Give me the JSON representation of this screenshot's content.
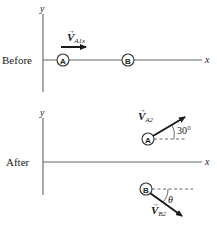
{
  "colors": {
    "ink": "#2a2a2a",
    "axis": "#555555",
    "background": "#ffffff"
  },
  "before": {
    "label": "Before",
    "y_axis_label": "y",
    "x_axis_label": "x",
    "particle_a": "A",
    "particle_b": "B",
    "velocity_label_main": "V",
    "velocity_label_sub": "A1x"
  },
  "after": {
    "label": "After",
    "y_axis_label": "y",
    "x_axis_label": "x",
    "particle_a": "A",
    "particle_b": "B",
    "velocity_a_main": "V",
    "velocity_a_sub": "A2",
    "angle_a": "30°",
    "velocity_b_main": "V",
    "velocity_b_sub": "B2",
    "angle_b": "θ"
  }
}
